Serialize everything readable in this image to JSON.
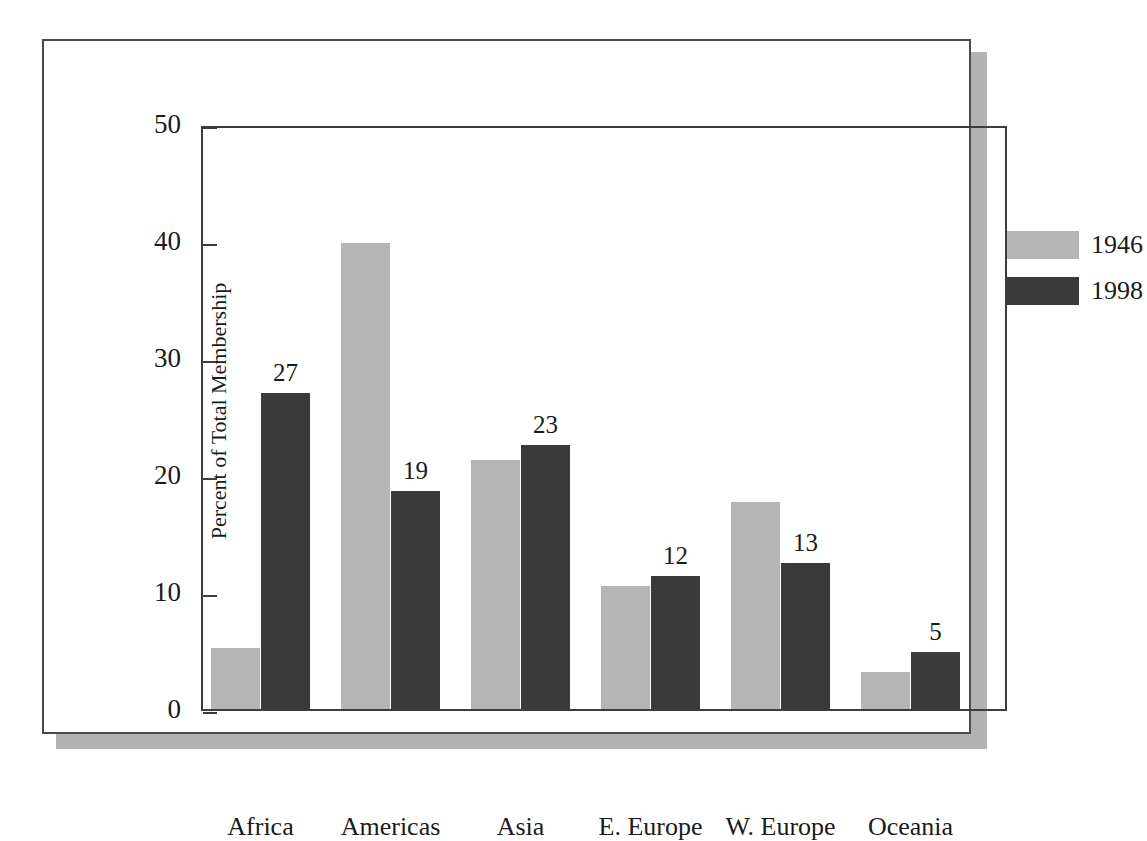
{
  "chart_data": {
    "type": "bar",
    "title": "",
    "xlabel": "",
    "ylabel": "Percent of Total Membership",
    "ylim": [
      0,
      50
    ],
    "ytick_labels": [
      "0",
      "10",
      "20",
      "30",
      "40",
      "50"
    ],
    "yticks": [
      0,
      10,
      20,
      30,
      40,
      50
    ],
    "grid": false,
    "legend_position": "top-right",
    "categories": [
      "Africa",
      "Americas",
      "Asia",
      "E. Europe",
      "W. Europe",
      "Oceania"
    ],
    "series": [
      {
        "name": "1946",
        "color": "#b5b5b5",
        "values": [
          5.2,
          39.8,
          21.3,
          10.5,
          17.7,
          3.2
        ],
        "labels": [
          "",
          "",
          "",
          "",
          "",
          ""
        ]
      },
      {
        "name": "1998",
        "color": "#3a3a3a",
        "values": [
          27,
          18.6,
          22.6,
          11.4,
          12.5,
          4.9
        ],
        "labels": [
          "27",
          "19",
          "23",
          "12",
          "13",
          "5"
        ]
      }
    ]
  },
  "legend": {
    "entries": [
      {
        "label": "1946"
      },
      {
        "label": "1998"
      }
    ]
  },
  "colors": {
    "series_1946": "#b5b5b5",
    "series_1998": "#3a3a3a",
    "axis": "#3d3d3d",
    "frame": "#4a4a4a",
    "shadow": "#b3b3b3",
    "text": "#1a1a1a",
    "background": "#ffffff"
  }
}
